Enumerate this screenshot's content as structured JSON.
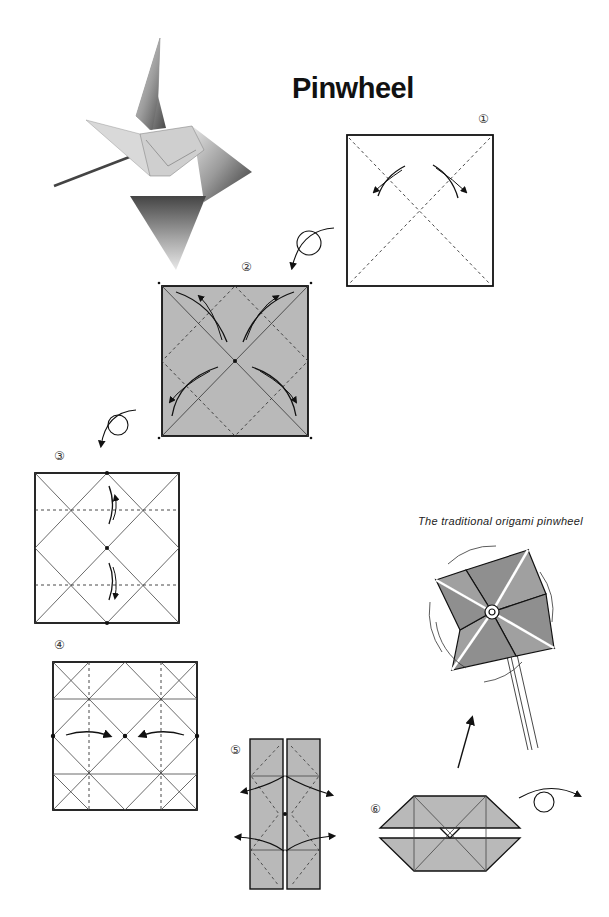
{
  "page": {
    "title": "Pinwheel",
    "caption": "The traditional origami pinwheel"
  },
  "steps": [
    {
      "number": "①",
      "description": "square with diagonal valley folds, fold and unfold"
    },
    {
      "number": "②",
      "description": "gray side, fold corners to center and unfold"
    },
    {
      "number": "③",
      "description": "fold top and bottom edges to center line"
    },
    {
      "number": "④",
      "description": "fold left and right edges to center"
    },
    {
      "number": "⑤",
      "description": "pull out corners"
    },
    {
      "number": "⑥",
      "description": "flattened shape, turn over"
    }
  ],
  "colors": {
    "paper_gray": "#b9b9b9",
    "line": "#222222",
    "background": "#ffffff"
  }
}
